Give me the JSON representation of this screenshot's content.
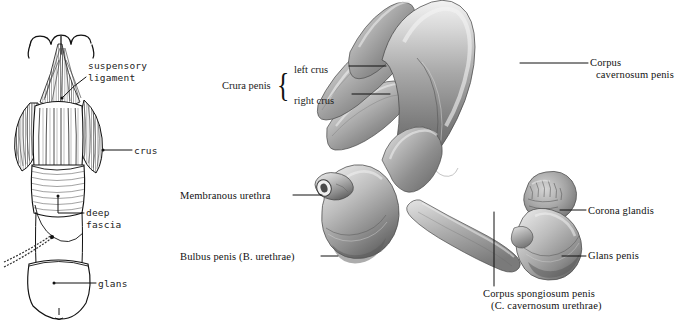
{
  "plate": {
    "background_color": "#ffffff",
    "ink_color": "#111111"
  },
  "figure_left": {
    "name": "penis-with-suspensory-ligament-line-drawing",
    "style": "pen-and-ink line drawing with hatching",
    "labels": [
      {
        "id": "suspensory-ligament",
        "text_line1": "suspensory",
        "text_line2": "ligament",
        "x": 88,
        "y": 60
      },
      {
        "id": "crus",
        "text_line1": "crus",
        "text_line2": "",
        "x": 134,
        "y": 145
      },
      {
        "id": "deep-fascia",
        "text_line1": "deep",
        "text_line2": "fascia",
        "x": 86,
        "y": 209
      },
      {
        "id": "glans",
        "text_line1": "glans",
        "text_line2": "",
        "x": 98,
        "y": 278
      }
    ]
  },
  "figure_right": {
    "name": "corpora-cavernosa-and-corpus-spongiosum-engraving",
    "style": "halftone anatomical engraving",
    "labels": [
      {
        "id": "corpus-cavernosum-penis",
        "text_line1": "Corpus",
        "text_line2": "cavernosum penis",
        "x": 590,
        "y": 57
      },
      {
        "id": "membranous-urethra",
        "text_line1": "Membranous urethra",
        "text_line2": "",
        "x": 180,
        "y": 190
      },
      {
        "id": "bulbus-penis",
        "text_line1": "Bulbus penis (B. urethrae)",
        "text_line2": "",
        "x": 180,
        "y": 251
      },
      {
        "id": "corona-glandis",
        "text_line1": "Corona glandis",
        "text_line2": "",
        "x": 588,
        "y": 205
      },
      {
        "id": "glans-penis",
        "text_line1": "Glans penis",
        "text_line2": "",
        "x": 588,
        "y": 250
      },
      {
        "id": "corpus-spongiosum-penis",
        "text_line1": "Corpus spongiosum penis",
        "text_line2": "(C. cavernosum urethrae)",
        "x": 483,
        "y": 290
      }
    ],
    "brace_group": {
      "id": "crura-penis",
      "group_label": "Crura penis",
      "items": [
        {
          "id": "left-crus",
          "text": "left crus"
        },
        {
          "id": "right-crus",
          "text": "right crus"
        }
      ],
      "x": 222,
      "y": 68
    }
  }
}
